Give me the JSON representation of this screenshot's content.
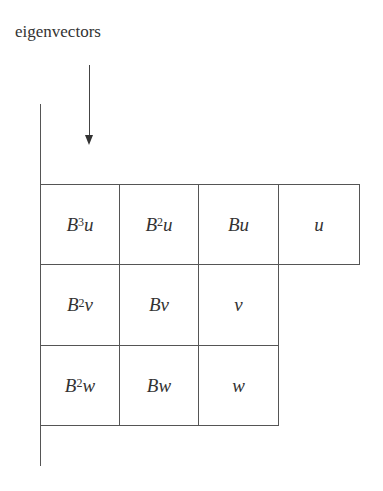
{
  "diagram": {
    "label": "eigenvectors",
    "rows": [
      {
        "cells": [
          {
            "base": "B",
            "exp": "3",
            "vec": "u"
          },
          {
            "base": "B",
            "exp": "2",
            "vec": "u"
          },
          {
            "base": "B",
            "exp": "",
            "vec": "u"
          },
          {
            "base": "",
            "exp": "",
            "vec": "u"
          }
        ]
      },
      {
        "cells": [
          {
            "base": "B",
            "exp": "2",
            "vec": "v"
          },
          {
            "base": "B",
            "exp": "",
            "vec": "v"
          },
          {
            "base": "",
            "exp": "",
            "vec": "v"
          }
        ]
      },
      {
        "cells": [
          {
            "base": "B",
            "exp": "2",
            "vec": "w"
          },
          {
            "base": "B",
            "exp": "",
            "vec": "w"
          },
          {
            "base": "",
            "exp": "",
            "vec": "w"
          }
        ]
      }
    ]
  }
}
